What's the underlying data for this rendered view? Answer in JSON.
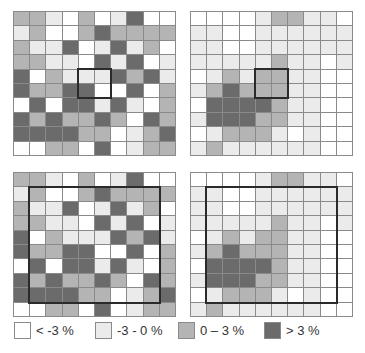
{
  "colors": {
    "W": "#ffffff",
    "L": "#ebebeb",
    "M": "#b4b4b4",
    "D": "#6b6b6b"
  },
  "panels": [
    {
      "name": "top-left",
      "box": {
        "col": 4,
        "row": 4,
        "cols": 2,
        "rows": 2
      },
      "rows": [
        "MMLWMWLDWW",
        "LMWWMDMMMM",
        "MLLDWLDLMW",
        "MMLLWDLDWL",
        "DWMLLLDMDL",
        "DMMDDWWDWM",
        "WDWDDLDLWM",
        "DMDMMDMWDM",
        "DDDDMMWLMD",
        "WWMMWDWLMM"
      ]
    },
    {
      "name": "top-right",
      "box": {
        "col": 4,
        "row": 4,
        "cols": 2,
        "rows": 2
      },
      "rows": [
        "WWWWLMMLLW",
        "LLWWLLLLLL",
        "LLWWLLLLLL",
        "LLLLLMLLWL",
        "WLMLMMLLWW",
        "LMDMMMLLWW",
        "WDDDDMLLWW",
        "LDDDMMLLWW",
        "WLMMMLWLWW",
        "LMLLLLLLWW"
      ]
    },
    {
      "name": "bottom-left",
      "box": {
        "col": 1,
        "row": 1,
        "cols": 8,
        "rows": 8
      },
      "rows": [
        "MMLWMWLDWW",
        "LMWWMDMMMM",
        "MLLDWLDLMW",
        "MMLLWDLDWL",
        "DWMLLLDMDL",
        "DMMDDWWDWM",
        "WDWDDLDLWM",
        "DMDMMDMWDM",
        "DDDDMMWLMD",
        "WWMMWDWLMM"
      ]
    },
    {
      "name": "bottom-right",
      "box": {
        "col": 1,
        "row": 1,
        "cols": 8,
        "rows": 8
      },
      "rows": [
        "WWWWLMMLLW",
        "LLWWLLLLLL",
        "LLWWLLLLLL",
        "LLLLLMLLWL",
        "WLMLMMLLWW",
        "LMDMMMLLWW",
        "WDDDDMLLWW",
        "LDDDMMLLWW",
        "WLMMMLWLWW",
        "LMLLLLLLWW"
      ]
    }
  ],
  "legend": {
    "items": [
      {
        "level": "W",
        "label": "< -3 %"
      },
      {
        "level": "L",
        "label": "-3 - 0 %"
      },
      {
        "level": "M",
        "label": "0 – 3 %"
      },
      {
        "level": "D",
        "label": "> 3 %"
      }
    ]
  }
}
